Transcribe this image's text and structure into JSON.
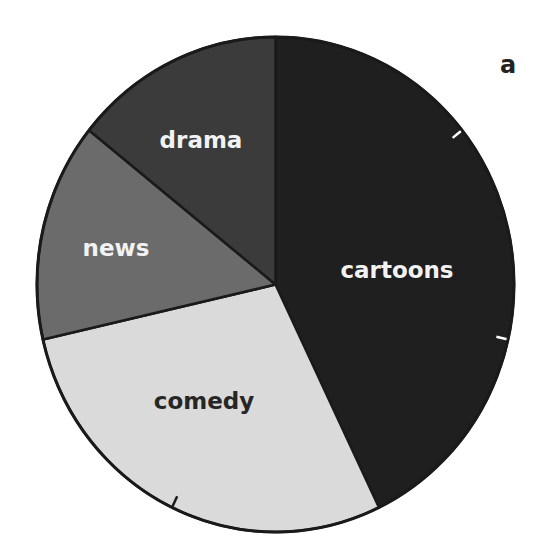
{
  "panel_label": "a",
  "chart_data": {
    "type": "pie",
    "title": "",
    "categories": [
      "cartoons",
      "comedy",
      "news",
      "drama"
    ],
    "values": [
      3,
      2,
      1,
      1
    ],
    "units_per_circle": 7,
    "start_angle_deg": 0,
    "direction": "clockwise",
    "colors": [
      "#1f1f1f",
      "#dadada",
      "#6b6b6b",
      "#3b3b3b"
    ],
    "label_colors": [
      "#f2f2f2",
      "#262626",
      "#f2f2f2",
      "#f2f2f2"
    ],
    "label_positions": [
      [
        397,
        270
      ],
      [
        204,
        401
      ],
      [
        116,
        248
      ],
      [
        201,
        140
      ]
    ],
    "tick_marks_every_units": 1,
    "legend": "none (labels inside slices)",
    "center": [
      275.5,
      284.5
    ],
    "radius": [
      238.5,
      247.5
    ]
  },
  "labels": {
    "cartoons": "cartoons",
    "comedy": "comedy",
    "news": "news",
    "drama": "drama"
  }
}
